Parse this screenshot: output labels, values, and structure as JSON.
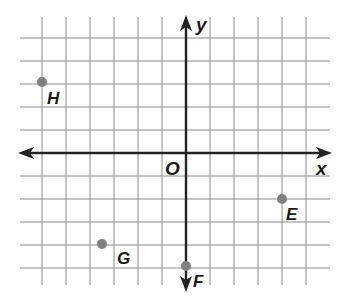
{
  "diagram": {
    "type": "coordinate-plane",
    "axes": {
      "x_label": "x",
      "y_label": "y",
      "origin_label": "O",
      "x_range": [
        -7,
        6
      ],
      "y_range": [
        -6,
        5
      ]
    },
    "grid": {
      "origin_px": [
        186,
        153
      ],
      "unit_x_px": 24,
      "unit_y_px": 23,
      "x_lines": [
        -6,
        -5,
        -4,
        -3,
        -2,
        -1,
        1,
        2,
        3,
        4,
        5
      ],
      "y_lines": [
        5,
        4,
        3,
        2,
        1,
        -1,
        -2,
        -3,
        -4,
        -5
      ],
      "line_color": "#8a8a8a",
      "axis_color": "#222222"
    },
    "points": [
      {
        "label": "H",
        "x": -6,
        "y": 3
      },
      {
        "label": "G",
        "x": -3.5,
        "y": -4
      },
      {
        "label": "E",
        "x": 4,
        "y": -2
      },
      {
        "label": "F",
        "x": 0,
        "y": -5
      }
    ],
    "point_color": "#808080"
  }
}
